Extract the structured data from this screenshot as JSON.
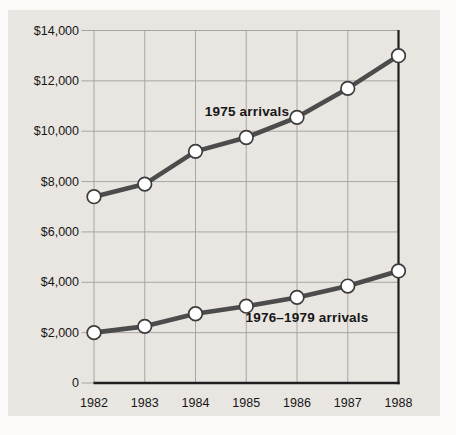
{
  "chart_data": {
    "type": "line",
    "title": "",
    "xlabel": "",
    "ylabel": "",
    "x": [
      1982,
      1983,
      1984,
      1985,
      1986,
      1987,
      1988
    ],
    "xtick_labels": [
      "1982",
      "1983",
      "1984",
      "1985",
      "1986",
      "1987",
      "1988"
    ],
    "ytick_values": [
      0,
      2000,
      4000,
      6000,
      8000,
      10000,
      12000,
      14000
    ],
    "ytick_labels": [
      "0",
      "$2,000",
      "$4,000",
      "$6,000",
      "$8,000",
      "$10,000",
      "$12,000",
      "$14,000"
    ],
    "ylim": [
      0,
      14000
    ],
    "grid": true,
    "legend_position": "inline-labels",
    "series": [
      {
        "name": "1975 arrivals",
        "values": [
          7400,
          7900,
          9200,
          9750,
          10550,
          11700,
          13000
        ]
      },
      {
        "name": "1976–1979 arrivals",
        "values": [
          2000,
          2250,
          2750,
          3050,
          3400,
          3850,
          4450
        ]
      }
    ]
  },
  "colors": {
    "page_background": "#fbfaf8",
    "panel_background": "#e9e5e1",
    "gridline": "#a8a6a3",
    "axis": "#1e1e1e",
    "series_line": "#4c4c4c",
    "marker_fill": "#ffffff",
    "marker_stroke": "#3c3c3c",
    "text": "#161616"
  }
}
